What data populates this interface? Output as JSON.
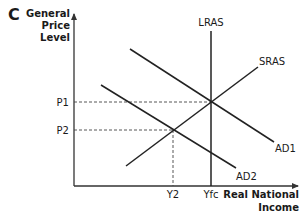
{
  "diagram": {
    "panel_label": "C",
    "y_axis_label": [
      "General",
      "Price",
      "Level"
    ],
    "x_axis_label": [
      "Real National",
      "Income"
    ],
    "curves": {
      "lras": "LRAS",
      "sras": "SRAS",
      "ad1": "AD1",
      "ad2": "AD2"
    },
    "price_levels": {
      "p1": "P1",
      "p2": "P2"
    },
    "income_levels": {
      "y2": "Y2",
      "yfc": "Yfc"
    },
    "colors": {
      "line": "#222222",
      "axis": "#333333",
      "dashed": "#444444"
    }
  }
}
